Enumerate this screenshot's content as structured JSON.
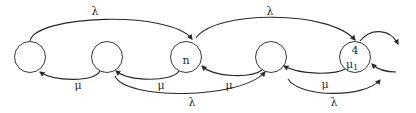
{
  "diagram": {
    "type": "state-transition",
    "states": [
      {
        "id": "s1",
        "label": "",
        "sublabel": "",
        "cx": 30,
        "cy": 57
      },
      {
        "id": "s2",
        "label": "",
        "sublabel": "",
        "cx": 107,
        "cy": 57
      },
      {
        "id": "s3",
        "label": "n",
        "sublabel": "",
        "cx": 186,
        "cy": 57
      },
      {
        "id": "s4",
        "label": "",
        "sublabel": "",
        "cx": 271,
        "cy": 57
      },
      {
        "id": "s5",
        "label": "4",
        "sublabel": "μ1",
        "cx": 355,
        "cy": 57
      }
    ],
    "transitions": [
      {
        "from": "s1",
        "to": "s3",
        "label": "λ",
        "position": "top"
      },
      {
        "from": "s3",
        "to": "s5",
        "label": "λ",
        "position": "top"
      },
      {
        "from": "s2",
        "to": "s1",
        "label": "μ",
        "position": "bottom"
      },
      {
        "from": "s3",
        "to": "s2",
        "label": "μ",
        "position": "bottom"
      },
      {
        "from": "s4",
        "to": "s3",
        "label": "μ",
        "position": "bottom"
      },
      {
        "from": "s5",
        "to": "s4",
        "label": "μ",
        "position": "bottom"
      },
      {
        "from": "s2",
        "to": "s4",
        "label": "λ",
        "position": "bottom"
      },
      {
        "from": "s4",
        "to": "out-right",
        "label": "λ",
        "position": "bottom"
      },
      {
        "from": "s5",
        "to": "out-right",
        "label": "",
        "position": "top"
      },
      {
        "from": "in-right",
        "to": "s5",
        "label": "",
        "position": "bottom"
      }
    ],
    "labels": {
      "lambda_top_left": "λ",
      "lambda_top_right": "λ",
      "mu_1": "μ",
      "mu_2": "μ",
      "mu_3": "μ",
      "mu_4": "μ",
      "lambda_bottom_left": "λ",
      "lambda_bottom_right": "λ",
      "node3_label": "n",
      "node5_top": "4",
      "node5_bottom_base": "μ",
      "node5_bottom_sub": "1"
    }
  }
}
